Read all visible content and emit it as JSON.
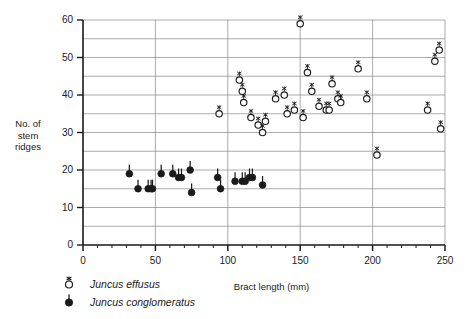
{
  "chart_data": {
    "type": "scatter",
    "title": "",
    "xlabel": "Bract length (mm)",
    "ylabel": "No. of stem ridges",
    "ylabel_lines": [
      "No. of",
      "stem",
      "ridges"
    ],
    "xlim": [
      0,
      250
    ],
    "ylim": [
      0,
      60
    ],
    "x_major_ticks": [
      0,
      50,
      100,
      150,
      200,
      250
    ],
    "x_tick_labels": [
      "0",
      "50",
      "100",
      "150",
      "200",
      "250"
    ],
    "x_minor_tick_step": 10,
    "y_major_ticks": [
      0,
      10,
      20,
      30,
      40,
      50,
      60
    ],
    "y_tick_labels": [
      "0",
      "10",
      "20",
      "30",
      "40",
      "50",
      "60"
    ],
    "y_gridlines": [
      5,
      10,
      15,
      20,
      25,
      30,
      35,
      40,
      45,
      50,
      55,
      60
    ],
    "grid": true,
    "grid_color": "#888888",
    "axis_color": "#1a1a1a",
    "legend_position": "below-left",
    "series": [
      {
        "name": "Juncus effusus",
        "marker": "open-circle-with-stalk",
        "marker_fill": "#ffffff",
        "marker_stroke": "#1a1a1a",
        "points": [
          [
            94,
            35
          ],
          [
            108,
            44
          ],
          [
            110,
            41
          ],
          [
            111,
            38
          ],
          [
            116,
            34
          ],
          [
            121,
            32
          ],
          [
            124,
            30
          ],
          [
            126,
            33
          ],
          [
            133,
            39
          ],
          [
            139,
            40
          ],
          [
            141,
            35
          ],
          [
            146,
            36
          ],
          [
            150,
            59
          ],
          [
            152,
            34
          ],
          [
            155,
            46
          ],
          [
            158,
            41
          ],
          [
            163,
            37
          ],
          [
            168,
            36
          ],
          [
            170,
            36
          ],
          [
            172,
            43
          ],
          [
            176,
            39
          ],
          [
            178,
            38
          ],
          [
            190,
            47
          ],
          [
            196,
            39
          ],
          [
            203,
            24
          ],
          [
            238,
            36
          ],
          [
            243,
            49
          ],
          [
            246,
            52
          ],
          [
            247,
            31
          ]
        ]
      },
      {
        "name": "Juncus conglomeratus",
        "marker": "filled-circle-with-stalk",
        "marker_fill": "#1a1a1a",
        "marker_stroke": "#1a1a1a",
        "points": [
          [
            32,
            19
          ],
          [
            38,
            15
          ],
          [
            45,
            15
          ],
          [
            47,
            15
          ],
          [
            48,
            15
          ],
          [
            54,
            19
          ],
          [
            62,
            19
          ],
          [
            66,
            18
          ],
          [
            68,
            18
          ],
          [
            74,
            20
          ],
          [
            75,
            14
          ],
          [
            93,
            18
          ],
          [
            95,
            15
          ],
          [
            105,
            17
          ],
          [
            110,
            17
          ],
          [
            112,
            17
          ],
          [
            115,
            18
          ],
          [
            117,
            18
          ],
          [
            124,
            16
          ]
        ]
      }
    ]
  },
  "legend": {
    "items": [
      {
        "label": "Juncus effusus",
        "marker": "open-circle-with-stalk"
      },
      {
        "label": "Juncus conglomeratus",
        "marker": "filled-circle-with-stalk"
      }
    ]
  }
}
